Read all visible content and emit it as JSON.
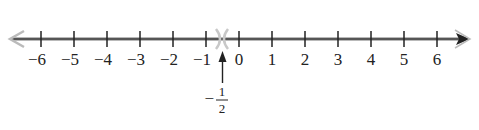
{
  "diagram": {
    "type": "number-line",
    "range": [
      -6,
      6
    ],
    "tick_labels": [
      "−6",
      "−5",
      "−4",
      "−3",
      "−2",
      "−1",
      "0",
      "1",
      "2",
      "3",
      "4",
      "5",
      "6"
    ],
    "marked_point": {
      "value": -0.5,
      "label_sign": "−",
      "label_numerator": "1",
      "label_denominator": "2",
      "marker": "open-parenthesis-pair"
    },
    "colors": {
      "line": "#333333",
      "arrow_left": "#bbbbbb",
      "marker": "#c8c8c8"
    }
  }
}
